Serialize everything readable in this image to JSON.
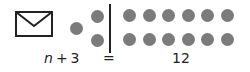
{
  "figure": {
    "background": "#ffffff",
    "ink_color": "#222222",
    "dot_color": "#7b7b7b"
  },
  "icons": {
    "envelope": "envelope-icon"
  },
  "equation": {
    "variable": "n",
    "operator": "+",
    "addend": "3",
    "equals_sign": "=",
    "result": "12",
    "left_dot_count": 3,
    "right_dot_count": 12
  }
}
